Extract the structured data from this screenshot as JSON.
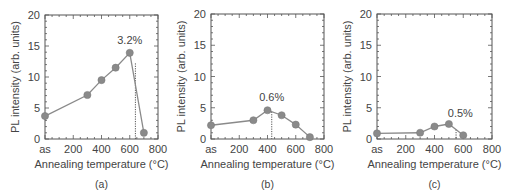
{
  "chart_data": [
    {
      "type": "line",
      "panel_label": "(a)",
      "title": "",
      "xlabel": "Annealing temperature (°C)",
      "ylabel": "PL intensity (arb. units)",
      "x_tick_labels": [
        "as",
        "200",
        "400",
        "600",
        "800"
      ],
      "y_tick_labels": [
        "0",
        "5",
        "10",
        "15",
        "20"
      ],
      "xlim": [
        0,
        800
      ],
      "ylim": [
        0,
        20
      ],
      "x": [
        "as",
        300,
        400,
        500,
        600,
        700
      ],
      "x_numeric": [
        0,
        300,
        400,
        500,
        600,
        700
      ],
      "values": [
        3.7,
        7.1,
        9.5,
        11.5,
        13.9,
        1.0
      ],
      "annotation": {
        "text": "3.2%",
        "x": 640,
        "dotted_line_x": 640,
        "label_x": 600,
        "label_y": 15.3
      },
      "marker_color": "#8a8a8a",
      "line_color": "#8a8a8a"
    },
    {
      "type": "line",
      "panel_label": "(b)",
      "title": "",
      "xlabel": "Annealing temperature (°C)",
      "ylabel": "PL intensity (arb. units)",
      "x_tick_labels": [
        "as",
        "200",
        "400",
        "600",
        "800"
      ],
      "y_tick_labels": [
        "0",
        "5",
        "10",
        "15",
        "20"
      ],
      "xlim": [
        0,
        800
      ],
      "ylim": [
        0,
        20
      ],
      "x": [
        "as",
        300,
        400,
        500,
        600,
        700
      ],
      "x_numeric": [
        0,
        300,
        400,
        500,
        600,
        700
      ],
      "values": [
        2.2,
        3.0,
        4.6,
        3.8,
        2.3,
        0.3
      ],
      "annotation": {
        "text": "0.6%",
        "x": 430,
        "dotted_line_x": 430,
        "label_x": 430,
        "label_y": 6.1
      },
      "marker_color": "#8a8a8a",
      "line_color": "#8a8a8a"
    },
    {
      "type": "line",
      "panel_label": "(c)",
      "title": "",
      "xlabel": "Annealing temperature (°C)",
      "ylabel": "PL intensity (arb. units)",
      "x_tick_labels": [
        "as",
        "200",
        "400",
        "600",
        "800"
      ],
      "y_tick_labels": [
        "0",
        "5",
        "10",
        "15",
        "20"
      ],
      "xlim": [
        0,
        800
      ],
      "ylim": [
        0,
        20
      ],
      "x": [
        "as",
        300,
        400,
        500,
        600
      ],
      "x_numeric": [
        0,
        300,
        400,
        500,
        600
      ],
      "values": [
        0.9,
        1.0,
        2.0,
        2.4,
        0.6
      ],
      "annotation": {
        "text": "0.5%",
        "x": 550,
        "dotted_line_x": 550,
        "label_x": 580,
        "label_y": 3.6
      },
      "marker_color": "#8a8a8a",
      "line_color": "#8a8a8a"
    }
  ],
  "layout": {
    "panels": [
      {
        "left": 45,
        "right": 158,
        "top": 15,
        "bottom": 139
      },
      {
        "left": 211,
        "right": 324,
        "top": 14,
        "bottom": 139
      },
      {
        "left": 377,
        "right": 492,
        "top": 14,
        "bottom": 139
      }
    ],
    "axis_color": "#555555",
    "text_color": "#444444"
  }
}
